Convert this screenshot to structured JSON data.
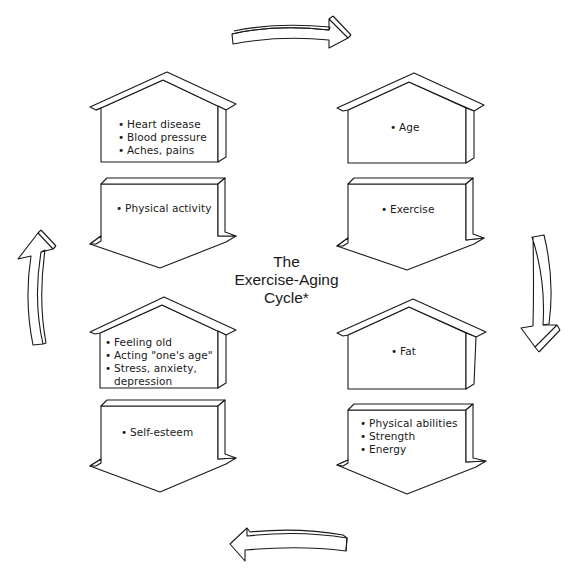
{
  "title": {
    "line1": "The",
    "line2": "Exercise-Aging",
    "line3": "Cycle*"
  },
  "quadrants": {
    "top_left": {
      "house": {
        "items": [
          "Heart disease",
          "Blood pressure",
          "Aches, pains"
        ]
      },
      "arrow": {
        "items": [
          "Physical activity"
        ]
      }
    },
    "top_right": {
      "house": {
        "items": [
          "Age"
        ]
      },
      "arrow": {
        "items": [
          "Exercise"
        ]
      }
    },
    "bottom_right": {
      "house": {
        "items": [
          "Fat"
        ]
      },
      "arrow": {
        "items": [
          "Physical abilities",
          "Strength",
          "Energy"
        ]
      }
    },
    "bottom_left": {
      "house": {
        "items": [
          "Feeling old",
          "Acting \"one's age\"",
          "Stress, anxiety,",
          "depression"
        ]
      },
      "arrow": {
        "items": [
          "Self-esteem"
        ]
      }
    }
  },
  "cycle_arrows": {
    "top": "arrow-right",
    "right": "arrow-down",
    "bottom": "arrow-left",
    "left": "arrow-up"
  },
  "colors": {
    "line": "#1a1a1a",
    "background": "#ffffff"
  }
}
